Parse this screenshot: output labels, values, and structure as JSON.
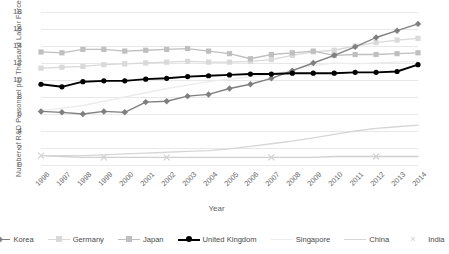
{
  "chart_data": {
    "type": "line",
    "title": "",
    "xlabel": "Year",
    "ylabel": "Number of R&D Personnel per Thousand Labor Force",
    "ylim": [
      0,
      18
    ],
    "yticks": [
      0,
      2,
      4,
      6,
      8,
      10,
      12,
      14,
      16,
      18
    ],
    "grid": true,
    "legend_position": "bottom",
    "categories": [
      1996,
      1997,
      1998,
      1999,
      2000,
      2001,
      2002,
      2003,
      2004,
      2005,
      2006,
      2007,
      2008,
      2009,
      2010,
      2011,
      2012,
      2013,
      2014
    ],
    "x": [
      "1996",
      "1997",
      "1998",
      "1999",
      "2000",
      "2001",
      "2002",
      "2003",
      "2004",
      "2005",
      "2006",
      "2007",
      "2008",
      "2009",
      "2010",
      "2011",
      "2012",
      "2013",
      "2014"
    ],
    "series": [
      {
        "name": "Korea",
        "color": "#7f7f7f",
        "marker": "diamond",
        "values": [
          6.3,
          6.2,
          6.0,
          6.3,
          6.2,
          7.4,
          7.5,
          8.1,
          8.3,
          9.0,
          9.5,
          10.2,
          11.1,
          12.0,
          12.9,
          13.9,
          15.0,
          15.8,
          16.6
        ]
      },
      {
        "name": "Germany",
        "color": "#d9d9d9",
        "marker": "square",
        "values": [
          11.4,
          11.5,
          11.6,
          11.8,
          11.9,
          12.0,
          12.1,
          12.2,
          12.1,
          12.1,
          12.2,
          12.4,
          12.9,
          13.3,
          13.5,
          14.0,
          14.4,
          14.7,
          14.9
        ]
      },
      {
        "name": "Japan",
        "color": "#bfbfbf",
        "marker": "square",
        "values": [
          13.3,
          13.2,
          13.6,
          13.6,
          13.4,
          13.5,
          13.6,
          13.7,
          13.4,
          13.1,
          12.5,
          13.0,
          13.2,
          13.4,
          12.9,
          13.0,
          13.0,
          13.1,
          13.2
        ]
      },
      {
        "name": "United Kingdom",
        "color": "#000000",
        "marker": "circle",
        "values": [
          9.5,
          9.2,
          9.8,
          9.9,
          9.9,
          10.1,
          10.2,
          10.4,
          10.5,
          10.6,
          10.7,
          10.7,
          10.8,
          10.8,
          10.8,
          10.9,
          10.9,
          11.0,
          11.8
        ]
      },
      {
        "name": "Singapore",
        "color": "#ececec",
        "marker": "none",
        "values": [
          6.4,
          6.7,
          7.0,
          7.5,
          8.0,
          8.5,
          9.0,
          9.4,
          9.8,
          10.1,
          10.4,
          10.6,
          11.2,
          11.7,
          12.0,
          11.9,
          12.0,
          12.1,
          12.2
        ]
      },
      {
        "name": "China",
        "color": "#d6d6d6",
        "marker": "none",
        "values": [
          1.1,
          1.1,
          1.1,
          1.2,
          1.3,
          1.4,
          1.5,
          1.6,
          1.7,
          1.9,
          2.2,
          2.5,
          2.8,
          3.2,
          3.6,
          4.0,
          4.3,
          4.5,
          4.7
        ]
      },
      {
        "name": "India",
        "color": "#d0d0d0",
        "marker": "x",
        "values": [
          1.1,
          1.0,
          0.9,
          0.9,
          0.9,
          0.9,
          0.9,
          0.9,
          0.9,
          0.9,
          0.9,
          0.9,
          0.9,
          0.9,
          1.0,
          1.0,
          1.0,
          1.0,
          1.0
        ]
      }
    ]
  }
}
